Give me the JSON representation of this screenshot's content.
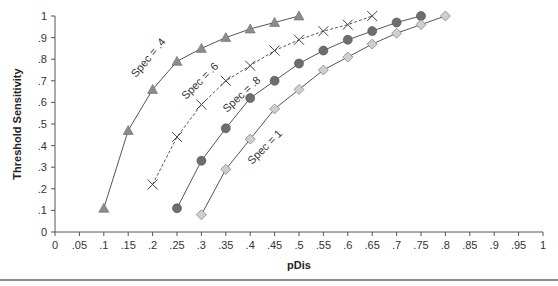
{
  "chart_data": {
    "type": "line",
    "title": "",
    "xlabel": "pDis",
    "ylabel": "Threshold Sensitivity",
    "xlim": [
      0,
      1
    ],
    "ylim": [
      0,
      1
    ],
    "grid": false,
    "legend": "inline labels",
    "x_ticks": [
      "0",
      ".05",
      ".1",
      ".15",
      ".2",
      ".25",
      ".3",
      ".35",
      ".4",
      ".45",
      ".5",
      ".55",
      ".6",
      ".65",
      ".7",
      ".75",
      ".8",
      ".85",
      ".9",
      ".95",
      "1"
    ],
    "y_ticks": [
      "0",
      ".1",
      ".2",
      ".3",
      ".4",
      ".5",
      ".6",
      ".7",
      ".8",
      ".9",
      "1"
    ],
    "series": [
      {
        "name": "Spec = .4",
        "marker": "triangle",
        "line": "solid",
        "x": [
          0.1,
          0.15,
          0.2,
          0.25,
          0.3,
          0.35,
          0.4,
          0.45,
          0.5
        ],
        "values": [
          0.11,
          0.47,
          0.66,
          0.79,
          0.85,
          0.9,
          0.94,
          0.97,
          1.0
        ]
      },
      {
        "name": "Spec = .6",
        "marker": "x",
        "line": "dashed",
        "x": [
          0.2,
          0.25,
          0.3,
          0.35,
          0.4,
          0.45,
          0.5,
          0.55,
          0.6,
          0.65
        ],
        "values": [
          0.22,
          0.44,
          0.59,
          0.7,
          0.77,
          0.84,
          0.89,
          0.93,
          0.96,
          1.0
        ]
      },
      {
        "name": "Spec = .8",
        "marker": "circle",
        "line": "solid",
        "x": [
          0.25,
          0.3,
          0.35,
          0.4,
          0.45,
          0.5,
          0.55,
          0.6,
          0.65,
          0.7,
          0.75
        ],
        "values": [
          0.11,
          0.33,
          0.48,
          0.62,
          0.7,
          0.78,
          0.84,
          0.89,
          0.93,
          0.97,
          1.0
        ]
      },
      {
        "name": "Spec = 1",
        "marker": "diamond",
        "line": "solid",
        "x": [
          0.3,
          0.35,
          0.4,
          0.45,
          0.5,
          0.55,
          0.6,
          0.65,
          0.7,
          0.75,
          0.8
        ],
        "values": [
          0.08,
          0.29,
          0.43,
          0.57,
          0.66,
          0.75,
          0.81,
          0.87,
          0.92,
          0.96,
          1.0
        ]
      }
    ],
    "series_label_positions": [
      {
        "text": "Spec = .4",
        "x": 136,
        "y": 78,
        "angle": -50
      },
      {
        "text": "Spec = .6",
        "x": 186,
        "y": 100,
        "angle": -45
      },
      {
        "text": "Spec = .8",
        "x": 227,
        "y": 113,
        "angle": -43
      },
      {
        "text": "Spec = 1",
        "x": 252,
        "y": 165,
        "angle": -45
      }
    ]
  },
  "colors": {
    "axis": "#555555",
    "line": "#555555",
    "triangle_fill": "#8c8c8c",
    "circle_fill": "#6e6e6e",
    "diamond_fill": "#cfcfcf",
    "x_marker": "#444444",
    "rule": "#8a8a8a"
  }
}
